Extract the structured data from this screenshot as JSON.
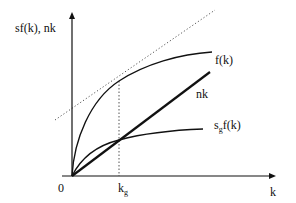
{
  "diagram": {
    "y_axis_label": "sf(k), nk",
    "x_axis_label": "k",
    "origin_label": "0",
    "kg_label_main": "k",
    "kg_label_sub": "g",
    "curves": {
      "f": {
        "label": "f(k)"
      },
      "nk": {
        "label": "nk"
      },
      "sgf": {
        "label_main": "s",
        "label_sub": "g",
        "label_rest": "f(k)"
      }
    },
    "tangent_line": "dotted tangent to f(k) at k_g, parallel to nk",
    "colors": {
      "line": "#111111",
      "background": "#ffffff",
      "dotted": "#555555"
    }
  }
}
